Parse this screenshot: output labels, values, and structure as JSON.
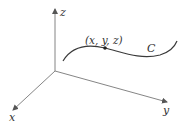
{
  "diagram": {
    "axes": {
      "x_label": "x",
      "y_label": "y",
      "z_label": "z"
    },
    "curve_label": "C",
    "point_label": "(x, y, z)",
    "colors": {
      "axis": "#555555",
      "curve": "#333333",
      "text": "#333333"
    }
  }
}
